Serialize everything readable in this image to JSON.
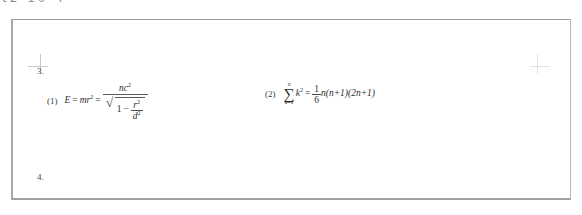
{
  "page": {
    "top_strip_text": "t2  10  4",
    "problems": [
      {
        "number": "3."
      },
      {
        "number": "4."
      }
    ]
  },
  "formulas": [
    {
      "tag": "(1)",
      "lhs_var": "E",
      "equals": "=",
      "expr_mr": "mr",
      "expr_mr_exp": "2",
      "fraction": {
        "numerator_base": "nc",
        "numerator_exp": "2",
        "denominator": {
          "radicand_lead": "1",
          "radicand_op": "−",
          "inner_fraction_num": "r",
          "inner_fraction_num_exp": "2",
          "inner_fraction_den": "d",
          "inner_fraction_den_exp": "2"
        }
      },
      "plain_text": "E = mr^2 = nc^2 / sqrt(1 - r^2/d^2)"
    },
    {
      "tag": "(2)",
      "sum_upper": "n",
      "sum_glyph": "∑",
      "sum_lower_var": "k",
      "sum_lower_eq": "=",
      "sum_lower_val": "1",
      "summand_base": "k",
      "summand_exp": "2",
      "equals": "=",
      "coefficient_num": "1",
      "coefficient_den": "6",
      "rhs": "n(n+1)(2n+1)",
      "plain_text": "sum_{k=1}^{n} k^2 = (1/6) n(n+1)(2n+1)"
    }
  ],
  "colors": {
    "ink": "#2e2e2e",
    "frame": "#a8a8a8",
    "crop_mark": "#c9c9c9",
    "paper": "#ffffff"
  }
}
